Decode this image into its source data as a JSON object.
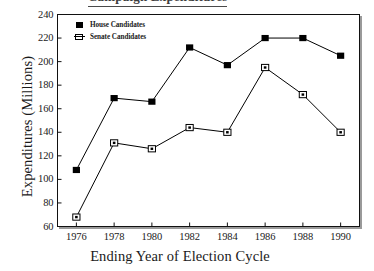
{
  "top_heading": {
    "text": "Campaign Expenditures"
  },
  "chart_data": {
    "type": "line",
    "title": "",
    "xlabel": "Ending Year of Election Cycle",
    "ylabel": "Expenditures (Millions)",
    "x": [
      1976,
      1978,
      1980,
      1982,
      1984,
      1986,
      1988,
      1990
    ],
    "xtick_labels": [
      "1976",
      "1978",
      "1980",
      "1982",
      "1984",
      "1986",
      "1988",
      "1990"
    ],
    "ytick_labels": [
      "240",
      "220",
      "200",
      "180",
      "160",
      "140",
      "120",
      "100",
      "80",
      "60"
    ],
    "yticks": [
      240,
      220,
      200,
      180,
      160,
      140,
      120,
      100,
      80,
      60
    ],
    "xlim": [
      1975,
      1991
    ],
    "ylim": [
      60,
      240
    ],
    "grid": false,
    "legend_position": "upper left inside",
    "series": [
      {
        "name": "House Candidates",
        "marker": "filled-square",
        "color": "#000000",
        "values": [
          108,
          169,
          166,
          212,
          197,
          220,
          220,
          205
        ]
      },
      {
        "name": "Senate Candidates",
        "marker": "open-square",
        "color": "#000000",
        "values": [
          68,
          131,
          126,
          144,
          140,
          195,
          172,
          140
        ]
      }
    ]
  }
}
